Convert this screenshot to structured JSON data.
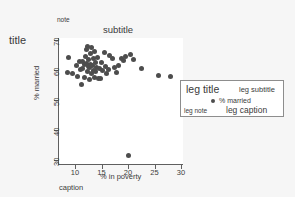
{
  "figure": {
    "background": "#f6f6f6",
    "plot_background": "#ffffff",
    "marker_color": "#4d4d4d",
    "axis_color": "#5f5f5f"
  },
  "texts": {
    "title": "title",
    "subtitle": "subtitle",
    "note": "note",
    "caption": "caption"
  },
  "legend": {
    "title": "leg title",
    "subtitle": "leg subtitle",
    "note": "leg note",
    "caption": "leg caption",
    "key_label": "% married",
    "border_color": "#8d8d8d"
  },
  "chart_data": {
    "type": "scatter",
    "title": "title",
    "subtitle": "subtitle",
    "note": "note",
    "caption": "caption",
    "xlabel": "% in poverty",
    "ylabel": "% married",
    "xlim": [
      8,
      31
    ],
    "ylim": [
      29,
      71
    ],
    "xticks": [
      10,
      15,
      20,
      25,
      30
    ],
    "yticks": [
      30,
      40,
      50,
      60,
      70
    ],
    "xtick_labels": [
      "10",
      "15",
      "20",
      "25",
      "30"
    ],
    "ytick_labels": [
      "30",
      "40",
      "50",
      "60",
      "70"
    ],
    "grid": false,
    "legend_position": "right",
    "series": [
      {
        "name": "% married",
        "marker": "circle",
        "color": "#4d4d4d",
        "points": [
          [
            8.5,
            59.2
          ],
          [
            8.7,
            64.1
          ],
          [
            9.6,
            58.8
          ],
          [
            10.3,
            61.6
          ],
          [
            10.5,
            58.0
          ],
          [
            10.8,
            62.9
          ],
          [
            11.0,
            60.1
          ],
          [
            11.2,
            55.3
          ],
          [
            11.4,
            63.0
          ],
          [
            11.5,
            60.4
          ],
          [
            11.7,
            57.4
          ],
          [
            11.8,
            61.8
          ],
          [
            12.0,
            64.6
          ],
          [
            12.1,
            66.9
          ],
          [
            12.2,
            62.2
          ],
          [
            12.3,
            59.6
          ],
          [
            12.4,
            68.0
          ],
          [
            12.5,
            61.2
          ],
          [
            12.6,
            63.5
          ],
          [
            12.7,
            57.0
          ],
          [
            12.8,
            60.9
          ],
          [
            12.9,
            65.5
          ],
          [
            13.0,
            62.0
          ],
          [
            13.1,
            59.0
          ],
          [
            13.2,
            67.5
          ],
          [
            13.3,
            61.5
          ],
          [
            13.4,
            63.8
          ],
          [
            13.5,
            60.0
          ],
          [
            13.6,
            57.6
          ],
          [
            13.7,
            66.3
          ],
          [
            13.8,
            62.6
          ],
          [
            13.9,
            59.4
          ],
          [
            14.0,
            61.0
          ],
          [
            14.2,
            64.2
          ],
          [
            14.4,
            57.2
          ],
          [
            14.6,
            60.6
          ],
          [
            14.8,
            57.3
          ],
          [
            15.0,
            62.4
          ],
          [
            15.2,
            59.8
          ],
          [
            15.5,
            65.9
          ],
          [
            15.8,
            61.3
          ],
          [
            16.0,
            58.7
          ],
          [
            16.3,
            60.2
          ],
          [
            16.6,
            65.0
          ],
          [
            17.0,
            63.9
          ],
          [
            17.4,
            60.8
          ],
          [
            17.8,
            59.2
          ],
          [
            18.3,
            61.4
          ],
          [
            18.8,
            64.0
          ],
          [
            19.2,
            63.2
          ],
          [
            19.6,
            64.4
          ],
          [
            20.0,
            31.5
          ],
          [
            20.4,
            65.2
          ],
          [
            21.0,
            63.6
          ],
          [
            22.6,
            60.5
          ],
          [
            25.8,
            58.2
          ],
          [
            28.0,
            57.9
          ]
        ]
      }
    ]
  }
}
